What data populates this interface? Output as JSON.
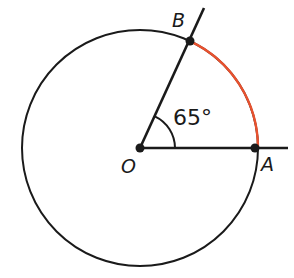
{
  "figure": {
    "type": "circle-central-angle-diagram",
    "background_color": "#ffffff",
    "stroke_color": "#1a1a1a",
    "arc_color": "#e8512e",
    "circle": {
      "center_label": "O",
      "center_x": 140,
      "center_y": 148,
      "radius": 118,
      "stroke_width": 2
    },
    "points": [
      {
        "label": "A",
        "x": 255,
        "y": 148,
        "angle_deg": 0,
        "dot_radius": 4.5,
        "label_x": 261,
        "label_y": 171
      },
      {
        "label": "B",
        "x": 190,
        "y": 41,
        "angle_deg": 65,
        "dot_radius": 4.5,
        "label_x": 172,
        "label_y": 27
      },
      {
        "label": "O",
        "x": 140,
        "y": 148,
        "angle_deg": null,
        "dot_radius": 4.5,
        "label_x": 121,
        "label_y": 173
      }
    ],
    "rays": [
      {
        "name": "ray-OA",
        "x1": 140,
        "y1": 148,
        "x2": 288,
        "y2": 148
      },
      {
        "name": "ray-OB",
        "x1": 140,
        "y1": 148,
        "x2": 204,
        "y2": 8
      }
    ],
    "highlighted_arc": {
      "name": "arc-AB",
      "from_point": "A",
      "to_point": "B",
      "start_angle_deg": 0,
      "end_angle_deg": 65,
      "color": "#e8512e",
      "stroke_width": 2,
      "path": "M 258 148 A 118 118 0 0 0 189.9 41.1"
    },
    "angle_marker": {
      "name": "central-angle-65",
      "value": "65°",
      "value_number": 65,
      "unit": "degrees",
      "arc_radius": 35,
      "path": "M 175 148 A 35 35 0 0 0 154.8 116.3",
      "label_x": 173,
      "label_y": 125
    }
  }
}
